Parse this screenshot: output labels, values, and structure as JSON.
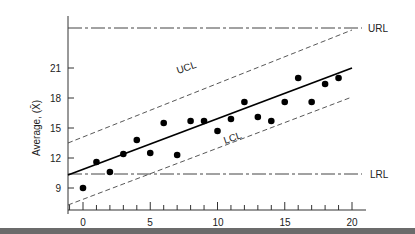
{
  "chart_data": {
    "type": "scatter",
    "title": "",
    "xlabel": "",
    "ylabel": "Average, (X̄)",
    "xlim": [
      -1,
      21
    ],
    "ylim": [
      7.5,
      23
    ],
    "x_ticks": [
      0,
      5,
      10,
      15,
      20
    ],
    "y_ticks": [
      9,
      12,
      15,
      18,
      21
    ],
    "grid": false,
    "legend": null,
    "series": [
      {
        "name": "Sample averages",
        "style": "filled-circle",
        "x": [
          0,
          1,
          2,
          3,
          4,
          5,
          6,
          7,
          8,
          9,
          10,
          11,
          12,
          13,
          14,
          15,
          16,
          17,
          18,
          19
        ],
        "y": [
          9.0,
          11.6,
          10.6,
          12.4,
          13.8,
          12.5,
          15.5,
          12.3,
          15.7,
          15.7,
          14.7,
          15.9,
          17.6,
          16.1,
          15.7,
          17.6,
          20.0,
          17.6,
          19.4,
          20.0
        ]
      }
    ],
    "lines": [
      {
        "name": "Center line",
        "style": "solid",
        "x": [
          -1,
          20
        ],
        "y": [
          10.5,
          20.1
        ]
      },
      {
        "name": "UCL",
        "label": "UCL",
        "style": "dashed",
        "x": [
          -1,
          20
        ],
        "y": [
          13.5,
          23.0
        ]
      },
      {
        "name": "LCL",
        "label": "LCL",
        "style": "dashed",
        "x": [
          -1,
          20
        ],
        "y": [
          7.6,
          17.2
        ]
      },
      {
        "name": "URL",
        "label": "URL",
        "style": "dash-dot",
        "x": [
          -1,
          20.5
        ],
        "y": [
          22.0,
          22.0
        ]
      },
      {
        "name": "LRL",
        "label": "LRL",
        "style": "dash-dot",
        "x": [
          -1,
          20.5
        ],
        "y": [
          7.8,
          7.8
        ]
      }
    ],
    "annotations": [
      "UCL",
      "LCL",
      "URL",
      "LRL"
    ]
  },
  "labels": {
    "y_axis_title": "Average, (X̄)",
    "url": "URL",
    "lrl": "LRL",
    "ucl": "UCL",
    "lcl": "LCL",
    "x_tick_0": "0",
    "x_tick_5": "5",
    "x_tick_10": "10",
    "x_tick_15": "15",
    "x_tick_20": "20",
    "y_tick_9": "9",
    "y_tick_12": "12",
    "y_tick_15": "15",
    "y_tick_18": "18",
    "y_tick_21": "21"
  }
}
